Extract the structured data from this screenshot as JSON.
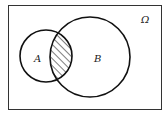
{
  "diagram": {
    "type": "venn",
    "universe": {
      "label": "Ω",
      "frame": {
        "x": 8,
        "y": 5,
        "width": 154,
        "height": 105
      }
    },
    "sets": [
      {
        "id": "A",
        "label": "A",
        "cx": 46,
        "cy": 56,
        "r": 26
      },
      {
        "id": "B",
        "label": "B",
        "cx": 90,
        "cy": 57,
        "r": 40
      }
    ],
    "shaded_region": {
      "description": "A ∩ B",
      "fill": "diagonal hatching"
    },
    "colors": {
      "stroke": "#111111",
      "background": "#ffffff",
      "frame": "#333333"
    }
  }
}
